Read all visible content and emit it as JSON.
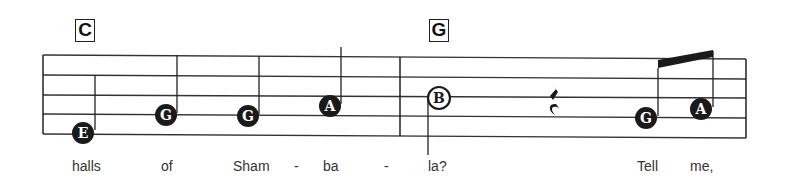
{
  "colors": {
    "ink": "#1a1a1a",
    "staff": "#333333",
    "paper": "#ffffff"
  },
  "chords": [
    {
      "label": "C",
      "x": 75,
      "y": 19
    },
    {
      "label": "G",
      "x": 429,
      "y": 19
    }
  ],
  "measures": [
    {
      "chord": "C",
      "notes": [
        {
          "letter": "E",
          "x": 83,
          "y": 133,
          "filled": true,
          "stem": "up"
        },
        {
          "letter": "G",
          "x": 166,
          "y": 115,
          "filled": true,
          "stem": "up"
        },
        {
          "letter": "G",
          "x": 248,
          "y": 116,
          "filled": true,
          "stem": "up"
        },
        {
          "letter": "A",
          "x": 330,
          "y": 106,
          "filled": true,
          "stem": "up"
        }
      ]
    },
    {
      "chord": "G",
      "notes": [
        {
          "letter": "B",
          "x": 439,
          "y": 98,
          "filled": false,
          "stem": "down"
        },
        {
          "rest": "quarter",
          "x": 555,
          "y": 98
        },
        {
          "letter": "G",
          "x": 646,
          "y": 118,
          "filled": true,
          "stem": "up",
          "beamed": true
        },
        {
          "letter": "A",
          "x": 701,
          "y": 109,
          "filled": true,
          "stem": "up",
          "beamed": true
        }
      ]
    }
  ],
  "lyrics": [
    {
      "text": "halls",
      "x": 72
    },
    {
      "text": "of",
      "x": 161
    },
    {
      "text": "Sham",
      "x": 233
    },
    {
      "text": "-",
      "x": 294
    },
    {
      "text": "ba",
      "x": 323
    },
    {
      "text": "-",
      "x": 384
    },
    {
      "text": "la?",
      "x": 428
    },
    {
      "text": "Tell",
      "x": 637
    },
    {
      "text": "me,",
      "x": 690
    }
  ]
}
